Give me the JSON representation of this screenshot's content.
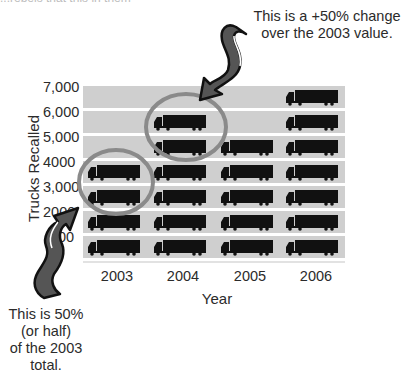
{
  "top_cut_text": "...rebels that this in them",
  "chart_data": {
    "type": "bar",
    "subtype": "pictograph",
    "title": "",
    "xlabel": "Year",
    "ylabel": "Trucks Recalled",
    "categories": [
      "2003",
      "2004",
      "2005",
      "2006"
    ],
    "values": [
      4000,
      6000,
      5000,
      7000
    ],
    "unit_per_icon": 1000,
    "icon": "truck-icon",
    "yticks": [
      "7,000",
      "6,000",
      "5,000",
      "4000",
      "3,000",
      "2000",
      "00"
    ],
    "ylim": [
      0,
      7000
    ],
    "grid": "horizontal bands",
    "annotations": [
      {
        "text": "This is a +50% change over the 2003 value.",
        "target": "2004 rows 5,000-6,000"
      },
      {
        "text": "This is 50% (or half) of the 2003 total.",
        "target": "2003 rows 3,000-4,000"
      }
    ]
  },
  "annotations": {
    "top": [
      "This is a +50% change",
      "over the 2003 value."
    ],
    "bottom": [
      "This is 50%",
      "(or half)",
      "of the 2003",
      "total."
    ]
  },
  "axis": {
    "ylabel": "Trucks Recalled",
    "xlabel": "Year",
    "yticks": [
      "7,000",
      "6,000",
      "5,000",
      "4000",
      "3,000",
      "2000",
      "00"
    ],
    "xticks": [
      "2003",
      "2004",
      "2005",
      "2006"
    ]
  },
  "colors": {
    "band": "#cfcfcf",
    "truck": "#111111",
    "circle": "#8a8a8a",
    "arrow_fill": "#555555",
    "arrow_outline": "#111111",
    "text": "#2b2b2b"
  }
}
